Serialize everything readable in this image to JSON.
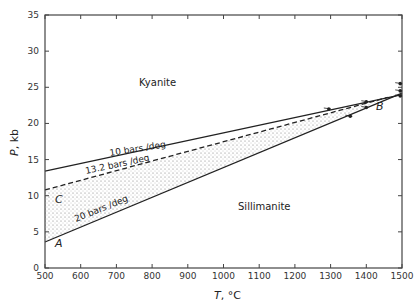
{
  "chart_data": {
    "type": "line",
    "title": "",
    "xlabel": "T, °C",
    "ylabel": "P, kb",
    "xlim": [
      500,
      1500
    ],
    "ylim": [
      0,
      35
    ],
    "x_ticks": [
      500,
      600,
      700,
      800,
      900,
      1000,
      1100,
      1200,
      1300,
      1400,
      1500
    ],
    "y_ticks": [
      0,
      5,
      10,
      15,
      20,
      25,
      30,
      35
    ],
    "grid": false,
    "legend": null,
    "regions": [
      {
        "label": "Kyanite",
        "x": 760,
        "y": 26.5
      },
      {
        "label": "Sillimanite",
        "x": 1150,
        "y": 10.8
      }
    ],
    "series": [
      {
        "name": "10 bars/deg",
        "style": "solid",
        "x": [
          500,
          1500
        ],
        "y": [
          13.4,
          24.0
        ]
      },
      {
        "name": "13.2 bars/deg",
        "style": "dashed",
        "x": [
          500,
          1460
        ],
        "y": [
          10.8,
          23.6
        ]
      },
      {
        "name": "20 bars/deg",
        "style": "solid",
        "x": [
          500,
          1500
        ],
        "y": [
          3.6,
          24.2
        ]
      }
    ],
    "shaded_region": {
      "between": [
        "13.2 bars/deg",
        "20 bars/deg"
      ],
      "fill": "stippled"
    },
    "point_labels": [
      {
        "label": "A",
        "x": 535,
        "y": 2.2
      },
      {
        "label": "B",
        "x": 1455,
        "y": 22.0
      },
      {
        "label": "C",
        "x": 535,
        "y": 9.4
      }
    ],
    "data_points": [
      {
        "x": 1295,
        "y": 22.0
      },
      {
        "x": 1355,
        "y": 21.0
      },
      {
        "x": 1400,
        "y": 22.2
      },
      {
        "x": 1400,
        "y": 23.0
      },
      {
        "x": 1495,
        "y": 23.8
      },
      {
        "x": 1495,
        "y": 24.5
      },
      {
        "x": 1495,
        "y": 25.5
      }
    ]
  },
  "labels": {
    "kyanite": "Kyanite",
    "sillimanite": "Sillimanite",
    "line10": "10 bars /deg",
    "line13": "13.2 bars /deg",
    "line20": "20 bars /deg",
    "A": "A",
    "B": "B",
    "C": "C",
    "xlabel": "T, °C",
    "ylabel": "P, kb"
  }
}
